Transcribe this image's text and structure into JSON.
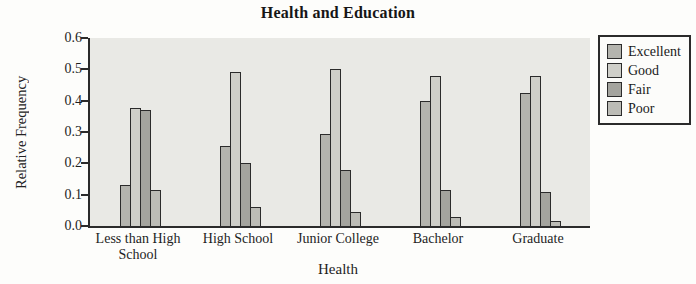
{
  "chart_data": {
    "type": "bar",
    "title": "Health and Education",
    "xlabel": "Health",
    "ylabel": "Relative Frequency",
    "ylim": [
      0.0,
      0.6
    ],
    "yticks": [
      0.0,
      0.1,
      0.2,
      0.3,
      0.4,
      0.5,
      0.6
    ],
    "ytick_labels": [
      "0.0",
      "0.1",
      "0.2",
      "0.3",
      "0.4",
      "0.5",
      "0.6"
    ],
    "categories": [
      "Less than High School",
      "High School",
      "Junior College",
      "Bachelor",
      "Graduate"
    ],
    "series": [
      {
        "name": "Excellent",
        "color": "#b4b4ae",
        "values": [
          0.13,
          0.255,
          0.295,
          0.4,
          0.425
        ]
      },
      {
        "name": "Good",
        "color": "#cfcfc9",
        "values": [
          0.375,
          0.49,
          0.5,
          0.48,
          0.48
        ]
      },
      {
        "name": "Fair",
        "color": "#a4a49e",
        "values": [
          0.37,
          0.2,
          0.18,
          0.115,
          0.11
        ]
      },
      {
        "name": "Poor",
        "color": "#bcbcb6",
        "values": [
          0.115,
          0.06,
          0.045,
          0.03,
          0.015
        ]
      }
    ],
    "legend_position": "right",
    "grid": false,
    "plot_bg": "#e9e9e5",
    "axis_color": "#2b2b2b"
  }
}
